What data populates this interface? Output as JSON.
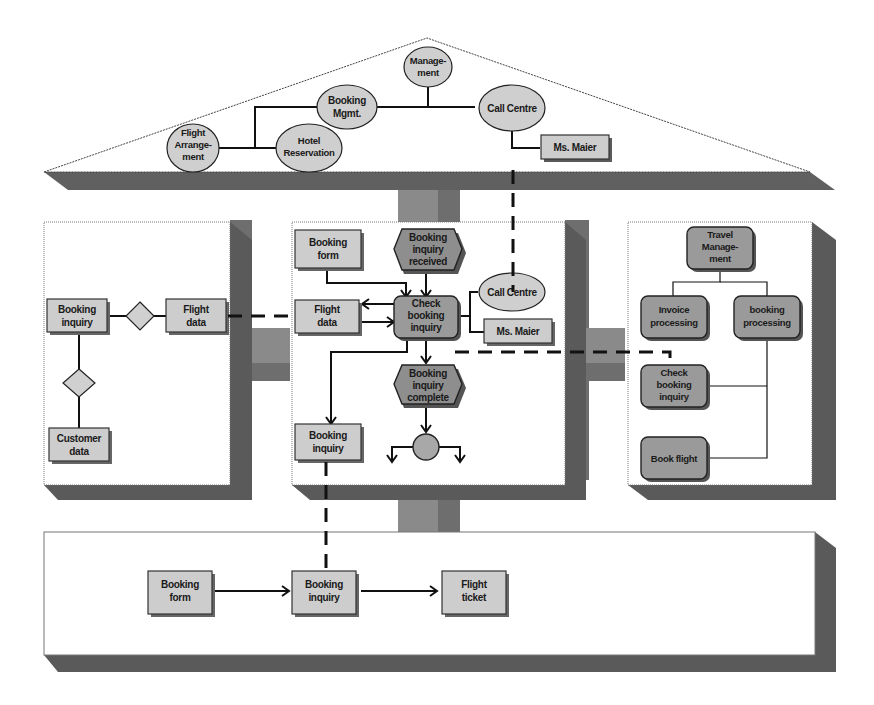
{
  "diagram": {
    "colors": {
      "shadow": "#5a5a5a",
      "node_light": "#cdcdcd",
      "node_dark": "#9a9a9a",
      "event": "#8e8e8e",
      "background": "#ffffff"
    },
    "organization_view": {
      "nodes": {
        "management": [
          "Manage-",
          "ment"
        ],
        "booking_mgmt": [
          "Booking",
          "Mgmt."
        ],
        "call_centre": [
          "Call Centre"
        ],
        "flight_arrangement": [
          "Flight",
          "Arrange-",
          "ment"
        ],
        "hotel_reservation": [
          "Hotel",
          "Reservation"
        ],
        "ms_maier": [
          "Ms. Maier"
        ]
      }
    },
    "data_view": {
      "nodes": {
        "booking_inquiry": [
          "Booking",
          "inquiry"
        ],
        "flight_data": [
          "Flight",
          "data"
        ],
        "customer_data": [
          "Customer",
          "data"
        ]
      }
    },
    "control_view": {
      "nodes": {
        "booking_form": [
          "Booking",
          "form"
        ],
        "booking_inquiry_received": [
          "Booking",
          "inquiry",
          "received"
        ],
        "check_booking_inquiry": [
          "Check",
          "booking",
          "inquiry"
        ],
        "flight_data": [
          "Flight",
          "data"
        ],
        "call_centre": [
          "Call Centre"
        ],
        "ms_maier": [
          "Ms. Maier"
        ],
        "booking_inquiry_complete": [
          "Booking",
          "inquiry",
          "complete"
        ],
        "booking_inquiry": [
          "Booking",
          "inquiry"
        ]
      }
    },
    "function_view": {
      "nodes": {
        "travel_management": [
          "Travel",
          "Manage-",
          "ment"
        ],
        "invoice_processing": [
          "Invoice",
          "processing"
        ],
        "booking_processing": [
          "booking",
          "processing"
        ],
        "check_booking_inquiry": [
          "Check",
          "booking",
          "inquiry"
        ],
        "book_flight": [
          "Book flight"
        ]
      }
    },
    "output_view": {
      "nodes": {
        "booking_form": [
          "Booking",
          "form"
        ],
        "booking_inquiry": [
          "Booking",
          "inquiry"
        ],
        "flight_ticket": [
          "Flight",
          "ticket"
        ]
      }
    }
  }
}
